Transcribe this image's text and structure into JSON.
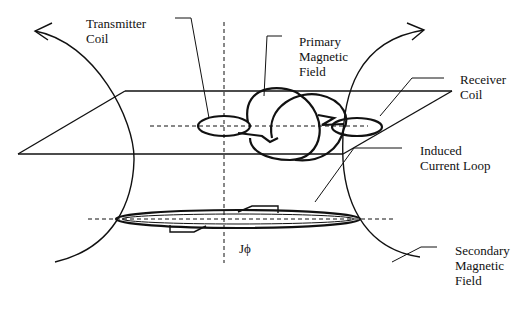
{
  "diagram": {
    "type": "electromagnetic induction schematic",
    "labels": {
      "transmitter_coil": [
        "Transmitter",
        "Coil"
      ],
      "primary_field": [
        "Primary",
        "Magnetic",
        "Field"
      ],
      "receiver_coil": [
        "Receiver",
        "Coil"
      ],
      "induced_loop": [
        "Induced",
        "Current Loop"
      ],
      "secondary_field": [
        "Secondary",
        "Magnetic",
        "Field"
      ],
      "current_density": "Jϕ"
    },
    "colors": {
      "line": "#111111",
      "background": "#ffffff"
    }
  }
}
